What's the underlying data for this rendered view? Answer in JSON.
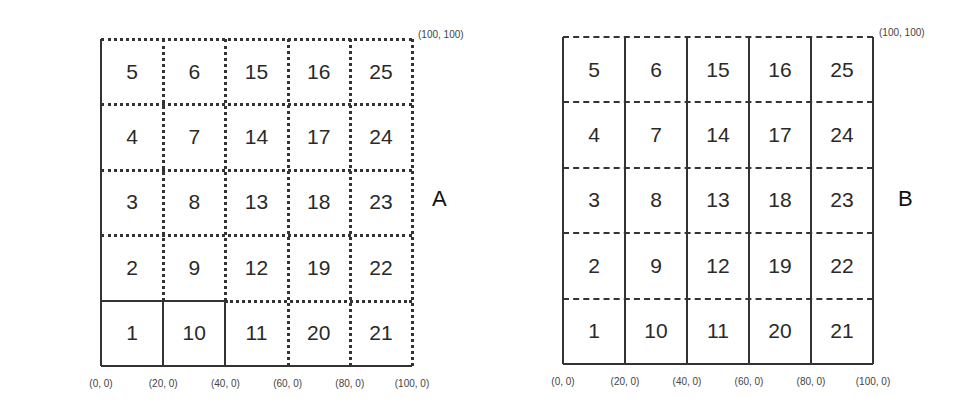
{
  "panels": [
    {
      "label": "A",
      "y_coords": [
        "(0, 100)",
        "(0, 80)",
        "(0, 60)",
        "(0, 40)",
        "(0, 20)"
      ],
      "top_right_coord": "(100, 100)",
      "x_coords": [
        "(0, 0)",
        "(20, 0)",
        "(40, 0)",
        "(60, 0)",
        "(80, 0)",
        "(100, 0)"
      ],
      "rows": [
        [
          "5",
          "6",
          "15",
          "16",
          "25"
        ],
        [
          "4",
          "7",
          "14",
          "17",
          "24"
        ],
        [
          "3",
          "8",
          "13",
          "18",
          "23"
        ],
        [
          "2",
          "9",
          "12",
          "19",
          "22"
        ],
        [
          "1",
          "10",
          "11",
          "20",
          "21"
        ]
      ],
      "line_style": "dotted grid; solid left & bottom border; cells 1 and 10 outlined solid"
    },
    {
      "label": "B",
      "y_coords": [
        "(0, 100)",
        "(0, 80)",
        "(0, 60)",
        "(0, 40)",
        "(0, 20)"
      ],
      "top_right_coord": "(100, 100)",
      "x_coords": [
        "(0, 0)",
        "(20, 0)",
        "(40, 0)",
        "(60, 0)",
        "(80, 0)",
        "(100, 0)"
      ],
      "rows": [
        [
          "5",
          "6",
          "15",
          "16",
          "25"
        ],
        [
          "4",
          "7",
          "14",
          "17",
          "24"
        ],
        [
          "3",
          "8",
          "13",
          "18",
          "23"
        ],
        [
          "2",
          "9",
          "12",
          "19",
          "22"
        ],
        [
          "1",
          "10",
          "11",
          "20",
          "21"
        ]
      ],
      "line_style": "solid vertical columns; dashed horizontal rows"
    }
  ]
}
